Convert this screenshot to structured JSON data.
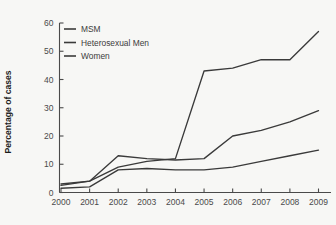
{
  "chart_data": {
    "type": "line",
    "title": "",
    "xlabel": "",
    "ylabel": "Percentage of cases",
    "categories": [
      "2000",
      "2001",
      "2002",
      "2003",
      "2004",
      "2005",
      "2006",
      "2007",
      "2008",
      "2009"
    ],
    "x": [
      2000,
      2001,
      2002,
      2003,
      2004,
      2005,
      2006,
      2007,
      2008,
      2009
    ],
    "xlim": [
      2000,
      2009
    ],
    "ylim": [
      0,
      60
    ],
    "yticks": [
      0,
      10,
      20,
      30,
      40,
      50,
      60
    ],
    "xticks": [
      "2000",
      "2001",
      "2002",
      "2003",
      "2004",
      "2005",
      "2006",
      "2007",
      "2008",
      "2009"
    ],
    "grid": false,
    "legend_position": "upper-left",
    "series": [
      {
        "name": "MSM",
        "color": "#3a3a3a",
        "values": [
          3,
          4,
          9,
          11,
          12,
          43,
          44,
          47,
          47,
          57
        ]
      },
      {
        "name": "Heterosexual Men",
        "color": "#3a3a3a",
        "values": [
          2.5,
          4,
          13,
          12,
          11.5,
          12,
          20,
          22,
          25,
          29
        ]
      },
      {
        "name": "Women",
        "color": "#3a3a3a",
        "values": [
          1.5,
          2,
          8,
          8.5,
          8,
          8,
          9,
          11,
          13,
          15
        ]
      }
    ]
  },
  "legend": {
    "entries": [
      {
        "label": "MSM"
      },
      {
        "label": "Heterosexual Men"
      },
      {
        "label": "Women"
      }
    ]
  },
  "axes": {
    "y_axis_title": "Percentage of cases",
    "y_tick_labels": [
      "0",
      "10",
      "20",
      "30",
      "40",
      "50",
      "60"
    ],
    "x_tick_labels": [
      "2000",
      "2001",
      "2002",
      "2003",
      "2004",
      "2005",
      "2006",
      "2007",
      "2008",
      "2009"
    ]
  },
  "colors": {
    "background": "#f7f7f5",
    "line": "#3a3a3a",
    "axis": "#4a4a4a",
    "text": "#3c3c3c"
  }
}
